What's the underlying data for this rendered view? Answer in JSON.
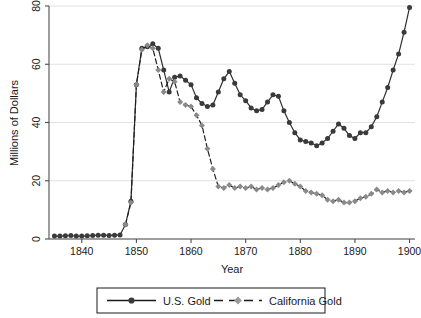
{
  "chart_data": {
    "type": "line",
    "title": "",
    "xlabel": "Year",
    "ylabel": "Millions of Dollars",
    "xlim": [
      1834,
      1901
    ],
    "ylim": [
      0,
      80
    ],
    "xticks": [
      1840,
      1850,
      1860,
      1870,
      1880,
      1890,
      1900
    ],
    "yticks": [
      0,
      20,
      40,
      60,
      80
    ],
    "grid": true,
    "legend_position": "below-axes",
    "series": [
      {
        "name": "U.S. Gold",
        "color": "#3a3a3a",
        "marker": "circle",
        "linestyle": "solid",
        "x": [
          1835,
          1836,
          1837,
          1838,
          1839,
          1840,
          1841,
          1842,
          1843,
          1844,
          1845,
          1846,
          1847,
          1848,
          1849,
          1850,
          1851,
          1852,
          1853,
          1854,
          1855,
          1856,
          1857,
          1858,
          1859,
          1860,
          1861,
          1862,
          1863,
          1864,
          1865,
          1866,
          1867,
          1868,
          1869,
          1870,
          1871,
          1872,
          1873,
          1874,
          1875,
          1876,
          1877,
          1878,
          1879,
          1880,
          1881,
          1882,
          1883,
          1884,
          1885,
          1886,
          1887,
          1888,
          1889,
          1890,
          1891,
          1892,
          1893,
          1894,
          1895,
          1896,
          1897,
          1898,
          1899,
          1900
        ],
        "y": [
          1.0,
          1.0,
          1.1,
          1.2,
          1.0,
          1.0,
          1.1,
          1.2,
          1.3,
          1.3,
          1.2,
          1.3,
          1.4,
          5.0,
          13.0,
          53.0,
          65.5,
          66.0,
          67.0,
          65.5,
          58.0,
          50.5,
          55.5,
          56.0,
          54.5,
          53.0,
          48.5,
          46.5,
          45.5,
          46.0,
          50.5,
          55.0,
          57.5,
          53.5,
          49.5,
          47.5,
          45.0,
          44.0,
          44.5,
          47.0,
          49.5,
          49.0,
          44.0,
          40.0,
          36.5,
          34.0,
          33.5,
          33.0,
          32.0,
          33.0,
          34.5,
          37.0,
          39.5,
          38.0,
          35.5,
          34.5,
          36.5,
          36.5,
          38.5,
          42.0,
          47.0,
          52.0,
          58.0,
          63.5,
          71.0,
          79.5
        ]
      },
      {
        "name": "California Gold",
        "color": "#8a8a8a",
        "marker": "diamond",
        "linestyle": "dashed",
        "x": [
          1848,
          1849,
          1850,
          1851,
          1852,
          1853,
          1854,
          1855,
          1856,
          1857,
          1858,
          1859,
          1860,
          1861,
          1862,
          1863,
          1864,
          1865,
          1866,
          1867,
          1868,
          1869,
          1870,
          1871,
          1872,
          1873,
          1874,
          1875,
          1876,
          1877,
          1878,
          1879,
          1880,
          1881,
          1882,
          1883,
          1884,
          1885,
          1886,
          1887,
          1888,
          1889,
          1890,
          1891,
          1892,
          1893,
          1894,
          1895,
          1896,
          1897,
          1898,
          1899,
          1900
        ],
        "y": [
          5.0,
          12.5,
          53.0,
          65.0,
          66.5,
          65.5,
          58.0,
          50.5,
          55.0,
          54.0,
          47.0,
          46.0,
          45.5,
          42.5,
          39.0,
          31.0,
          24.0,
          18.0,
          17.5,
          18.5,
          17.5,
          18.0,
          17.5,
          18.0,
          17.0,
          17.5,
          17.0,
          17.5,
          18.5,
          19.5,
          20.0,
          19.0,
          18.0,
          16.5,
          16.0,
          15.5,
          15.0,
          13.5,
          13.0,
          13.5,
          12.5,
          12.5,
          13.0,
          14.0,
          14.5,
          15.5,
          17.0,
          16.0,
          16.5,
          16.0,
          16.5,
          16.0,
          16.5
        ]
      }
    ]
  },
  "legend": {
    "entries": [
      {
        "label": "U.S. Gold"
      },
      {
        "label": "California Gold"
      }
    ]
  },
  "axes": {
    "y_title": "Millions of Dollars",
    "x_title": "Year",
    "x_tick_labels": [
      "1840",
      "1850",
      "1860",
      "1870",
      "1880",
      "1890",
      "1900"
    ],
    "y_tick_labels": [
      "0",
      "20",
      "40",
      "60",
      "80"
    ]
  },
  "colors": {
    "us_gold": "#3a3a3a",
    "california_gold": "#8a8a8a",
    "grid": "#d9d9d9",
    "axis": "#4d4d4d",
    "background": "#ffffff"
  }
}
